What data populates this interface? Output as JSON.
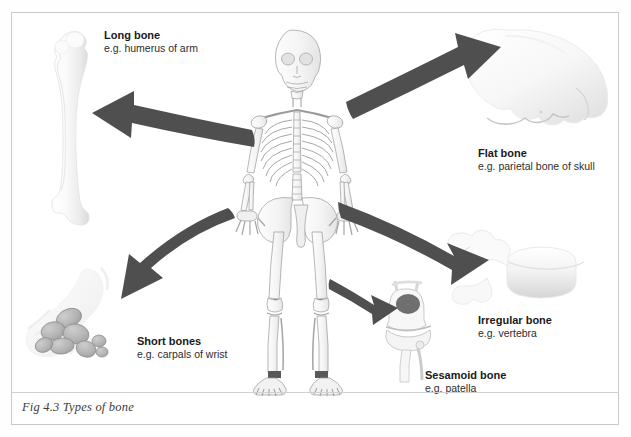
{
  "figure": {
    "caption": "Fig 4.3 Types of bone",
    "background_color": "#ffffff",
    "border_color": "#c9c9c9",
    "arrow_color": "#4f4f4f",
    "bone_light_color": "#f2f2f2",
    "bone_shade_color": "#b9b9b9"
  },
  "central_illustration": {
    "name": "human-skeleton-anterior-view",
    "description": "Full anterior human skeleton drawing in grey line art"
  },
  "labels": [
    {
      "id": "long",
      "title": "Long bone",
      "example": "e.g. humerus of arm",
      "illustration": "long-bone-humerus",
      "arrow": "curved-arrow-to-upper-left"
    },
    {
      "id": "flat",
      "title": "Flat bone",
      "example": "e.g. parietal bone of skull",
      "illustration": "flat-bone-skull",
      "arrow": "curved-arrow-to-upper-right"
    },
    {
      "id": "short",
      "title": "Short bones",
      "example": "e.g. carpals of wrist",
      "illustration": "short-bones-carpals",
      "arrow": "curved-arrow-to-lower-left"
    },
    {
      "id": "irregular",
      "title": "Irregular bone",
      "example": "e.g. vertebra",
      "illustration": "irregular-bone-vertebra",
      "arrow": "curved-arrow-to-lower-right"
    },
    {
      "id": "sesamoid",
      "title": "Sesamoid bone",
      "example": "e.g. patella",
      "illustration": "sesamoid-bone-knee-patella",
      "arrow": "curved-arrow-to-knee"
    }
  ]
}
